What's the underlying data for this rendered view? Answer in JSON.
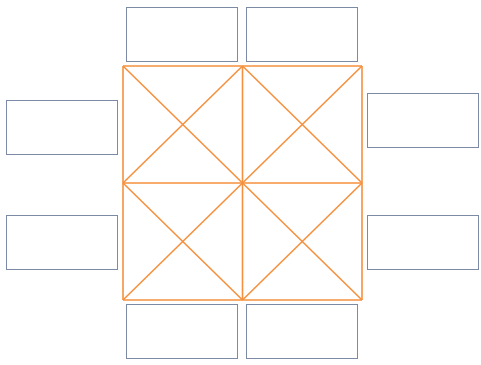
{
  "canvas": {
    "width": 481,
    "height": 365,
    "background": "#ffffff"
  },
  "colors": {
    "grid_stroke": "#f5913e",
    "box_stroke": "#7d8aa6"
  },
  "grid": {
    "x": 123,
    "y": 66,
    "width": 239,
    "height": 234,
    "rows": 2,
    "cols": 2,
    "center": [
      242,
      183
    ],
    "diagonals": "each-cell-crossed"
  },
  "boxes": [
    {
      "id": "top-left",
      "x": 126,
      "y": 7,
      "w": 112,
      "h": 55,
      "label": ""
    },
    {
      "id": "top-right",
      "x": 246,
      "y": 7,
      "w": 112,
      "h": 55,
      "label": ""
    },
    {
      "id": "left-top",
      "x": 6,
      "y": 100,
      "w": 112,
      "h": 55,
      "label": ""
    },
    {
      "id": "left-bottom",
      "x": 6,
      "y": 215,
      "w": 112,
      "h": 55,
      "label": ""
    },
    {
      "id": "right-top",
      "x": 367,
      "y": 93,
      "w": 112,
      "h": 55,
      "label": ""
    },
    {
      "id": "right-bottom",
      "x": 367,
      "y": 215,
      "w": 112,
      "h": 55,
      "label": ""
    },
    {
      "id": "bottom-left",
      "x": 126,
      "y": 304,
      "w": 112,
      "h": 55,
      "label": ""
    },
    {
      "id": "bottom-right",
      "x": 246,
      "y": 304,
      "w": 112,
      "h": 55,
      "label": ""
    }
  ]
}
